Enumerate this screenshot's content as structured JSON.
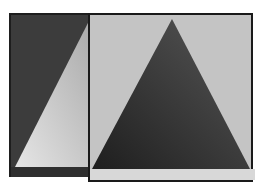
{
  "scene": {
    "description": "Two overlapping framed panels each showing a triangle",
    "back_panel": {
      "background": "#3c3c3c",
      "triangle_color": "#c8c8c8",
      "triangle": [
        [
          80,
          4
        ],
        [
          4,
          152
        ],
        [
          80,
          152
        ]
      ]
    },
    "front_panel": {
      "background": "#c4c4c4",
      "triangle_color": "#4a4a4a",
      "triangle": [
        [
          84,
          4
        ],
        [
          3,
          154
        ],
        [
          161,
          154
        ]
      ]
    }
  }
}
